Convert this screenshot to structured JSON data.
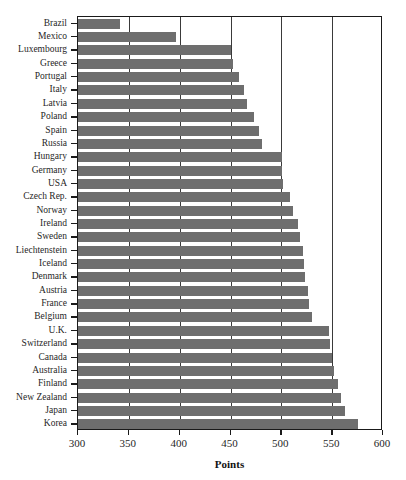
{
  "chart_data": {
    "type": "bar",
    "orientation": "horizontal",
    "title": "Scores",
    "xlabel": "Points",
    "ylabel": "",
    "xlim": [
      300,
      600
    ],
    "xticks": [
      300,
      350,
      400,
      450,
      500,
      550,
      600
    ],
    "grid": true,
    "gridlines_at": [
      350,
      400,
      450,
      500,
      550
    ],
    "legend": null,
    "bar_color": "#6e6e6e",
    "axis_color": "#1a1a1a",
    "categories": [
      "Brazil",
      "Mexico",
      "Luxembourg",
      "Greece",
      "Portugal",
      "Italy",
      "Latvia",
      "Poland",
      "Spain",
      "Russia",
      "Hungary",
      "Germany",
      "USA",
      "Czech Rep.",
      "Norway",
      "Ireland",
      "Sweden",
      "Liechtenstein",
      "Iceland",
      "Denmark",
      "Austria",
      "France",
      "Belgium",
      "U.K.",
      "Switzerland",
      "Canada",
      "Australia",
      "Finland",
      "New Zealand",
      "Japan",
      "Korea"
    ],
    "values": [
      341,
      396,
      450,
      452,
      458,
      463,
      466,
      473,
      478,
      481,
      501,
      501,
      502,
      509,
      511,
      516,
      518,
      521,
      522,
      523,
      526,
      527,
      530,
      547,
      548,
      550,
      552,
      556,
      559,
      563,
      575
    ]
  }
}
